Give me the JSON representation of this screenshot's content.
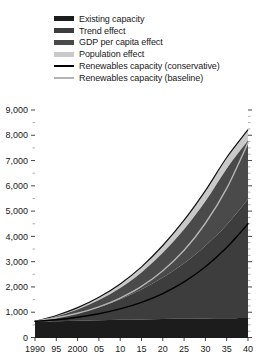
{
  "chart_data": {
    "type": "area",
    "title": "",
    "subtitle": "",
    "xlabel": "",
    "ylabel": "",
    "stacked": true,
    "grid": false,
    "legend_position": "top-left",
    "x": [
      1990,
      1995,
      2000,
      2005,
      2010,
      2015,
      2020,
      2025,
      2030,
      2035,
      2040
    ],
    "xtick_labels": [
      "1990",
      "95",
      "2000",
      "05",
      "10",
      "15",
      "20",
      "25",
      "30",
      "35",
      "40"
    ],
    "xlim": [
      1990,
      2040
    ],
    "ylim": [
      0,
      9000
    ],
    "ytick_labels": [
      "0",
      "1,000",
      "2,000",
      "3,000",
      "4,000",
      "5,000",
      "6,000",
      "7,000",
      "8,000",
      "9,000"
    ],
    "ytick_values": [
      0,
      1000,
      2000,
      3000,
      4000,
      5000,
      6000,
      7000,
      8000,
      9000
    ],
    "yminor_step": 500,
    "series": [
      {
        "name": "Existing capacity",
        "kind": "area",
        "color": "#1c1c1c",
        "values": [
          620,
          640,
          660,
          680,
          700,
          715,
          730,
          740,
          750,
          760,
          770
        ]
      },
      {
        "name": "Trend effect",
        "kind": "area",
        "color": "#3d3d3d",
        "values": [
          0,
          130,
          300,
          520,
          810,
          1180,
          1640,
          2200,
          2880,
          3700,
          4700
        ]
      },
      {
        "name": "GDP per capita effect",
        "kind": "area",
        "color": "#4a4a4a",
        "values": [
          0,
          60,
          150,
          280,
          450,
          680,
          980,
          1340,
          1760,
          2220,
          2320
        ]
      },
      {
        "name": "Population effect",
        "kind": "area",
        "color": "#c9c9c9",
        "values": [
          20,
          40,
          70,
          110,
          160,
          220,
          290,
          360,
          420,
          440,
          430
        ]
      }
    ],
    "lines": [
      {
        "name": "Renewables capacity (conservative)",
        "color": "#000000",
        "width": 1.4,
        "values": [
          640,
          700,
          800,
          940,
          1130,
          1390,
          1740,
          2200,
          2800,
          3560,
          4500
        ]
      },
      {
        "name": "Renewables capacity (baseline)",
        "color": "#b4b4b4",
        "width": 1.4,
        "values": [
          650,
          780,
          960,
          1210,
          1560,
          2020,
          2640,
          3450,
          4520,
          5900,
          7700
        ]
      }
    ],
    "stack_top_values": [
      640,
      870,
      1180,
      1590,
      2120,
      2795,
      3640,
      4640,
      5810,
      7120,
      8220
    ]
  },
  "legend": {
    "items": [
      {
        "label": "Existing capacity",
        "color": "#1c1c1c",
        "type": "swatch"
      },
      {
        "label": "Trend effect",
        "color": "#3d3d3d",
        "type": "swatch"
      },
      {
        "label": "GDP per capita effect",
        "color": "#4a4a4a",
        "type": "swatch"
      },
      {
        "label": "Population effect",
        "color": "#c9c9c9",
        "type": "swatch"
      },
      {
        "label": "Renewables capacity (conservative)",
        "color": "#000000",
        "type": "line"
      },
      {
        "label": "Renewables capacity (baseline)",
        "color": "#b4b4b4",
        "type": "line"
      }
    ]
  }
}
